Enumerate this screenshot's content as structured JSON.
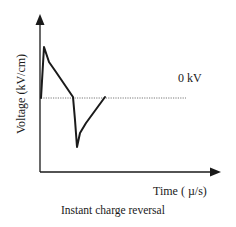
{
  "chart_data": {
    "type": "line",
    "title": "Instant charge reversal",
    "xlabel": "Time ( µ/s)",
    "ylabel": "Voltage (kV/cm)",
    "annotations": [
      {
        "text": "0 kV",
        "refers_to": "dotted zero-voltage baseline"
      }
    ],
    "grid": false,
    "legend": null,
    "axis_ticks": false,
    "baseline": {
      "value": 0,
      "style": "dotted",
      "label": "0 kV"
    },
    "series": [
      {
        "name": "Voltage waveform",
        "description": "Sharp positive spike followed by decay to 0, then instant reversal to a negative spike that decays back to 0",
        "points_px": [
          [
            41,
            98
          ],
          [
            44,
            47
          ],
          [
            49,
            62
          ],
          [
            56,
            72
          ],
          [
            73,
            97
          ],
          [
            75,
            120
          ],
          [
            77,
            147
          ],
          [
            80,
            133
          ],
          [
            86,
            123
          ],
          [
            105,
            97
          ]
        ],
        "relative_values": [
          {
            "t": 0.0,
            "v": 0.0
          },
          {
            "t": 0.05,
            "v": 1.0
          },
          {
            "t": 0.12,
            "v": 0.7
          },
          {
            "t": 0.23,
            "v": 0.5
          },
          {
            "t": 0.5,
            "v": 0.0
          },
          {
            "t": 0.53,
            "v": -0.45
          },
          {
            "t": 0.56,
            "v": -0.96
          },
          {
            "t": 0.61,
            "v": -0.69
          },
          {
            "t": 0.7,
            "v": -0.49
          },
          {
            "t": 1.0,
            "v": 0.0
          }
        ]
      }
    ],
    "colors": {
      "line": "#1a1a1a",
      "axis": "#1a1a1a",
      "baseline": "#555555"
    }
  },
  "labels": {
    "ylabel": "Voltage (kV/cm)",
    "zero": "0 kV",
    "xlabel": "Time ( µ/s)",
    "title": "Instant charge reversal"
  }
}
